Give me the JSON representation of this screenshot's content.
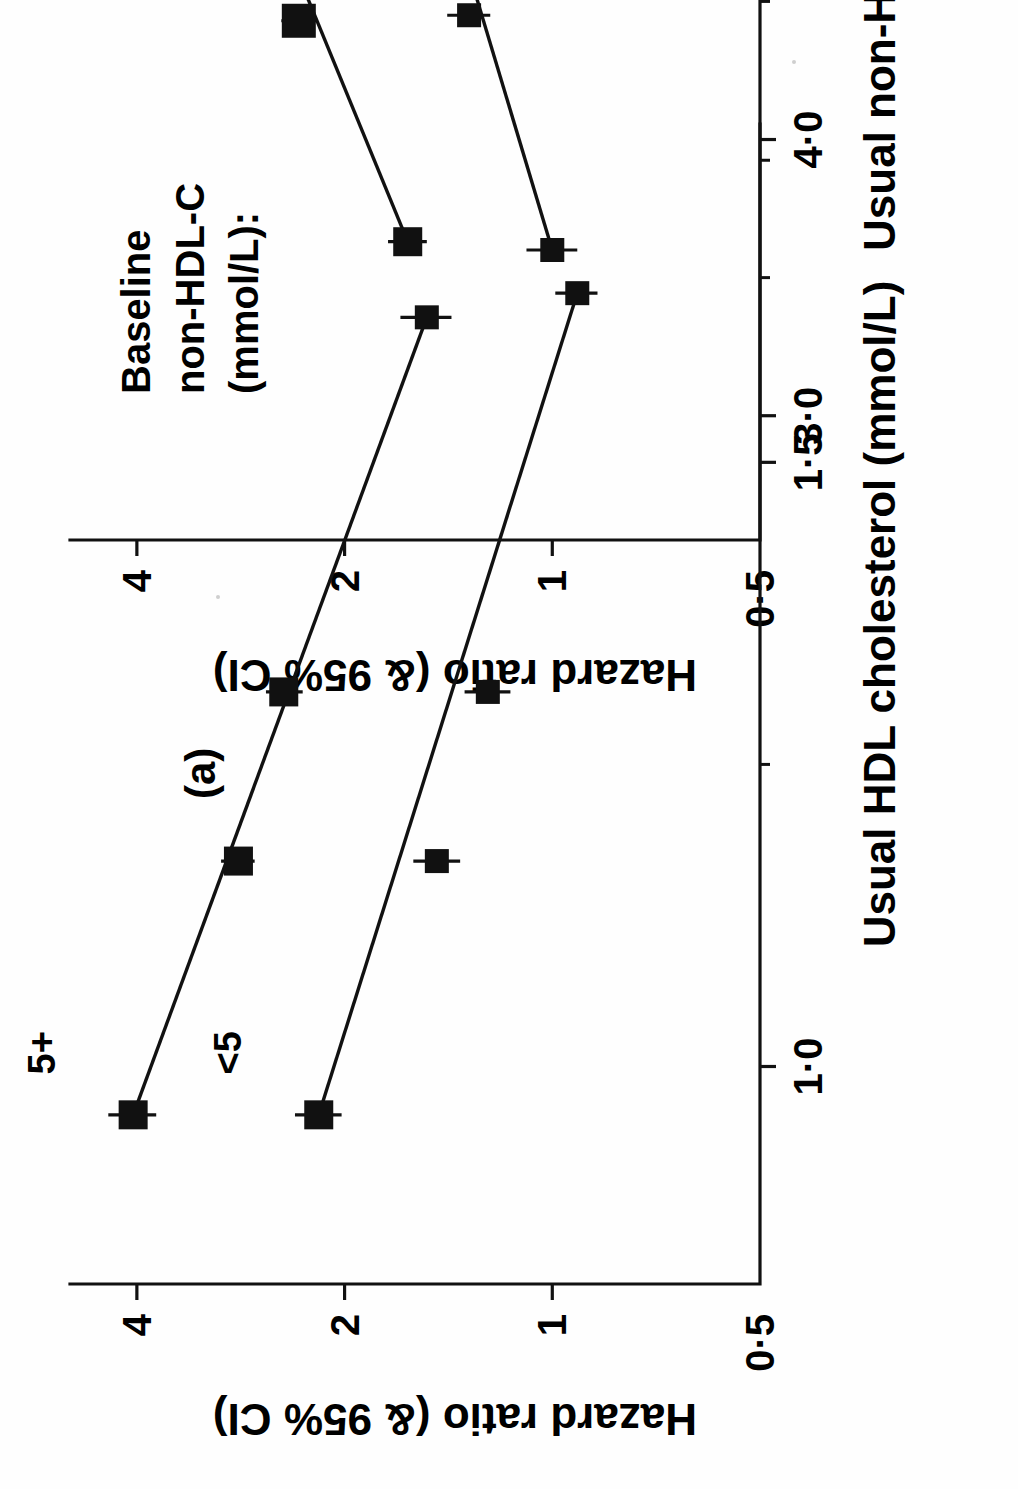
{
  "figure": {
    "background": "#ffffff",
    "ink_color": "#111111",
    "orientation": "rotated-90-ccw"
  },
  "chart_data": [
    {
      "id": "panel-a",
      "type": "scatter",
      "panel_label": "(a)",
      "title": "",
      "xlabel": "Usual HDL cholesterol (mmol/L)",
      "ylabel": "Hazard ratio (& 95% CI)",
      "xlim": [
        0.82,
        1.78
      ],
      "ylim": [
        0.5,
        5.0
      ],
      "yscale": "log",
      "grid": false,
      "xticks": [
        1.0,
        1.5
      ],
      "xticklabels": [
        "1·0",
        "1·5"
      ],
      "xminorticks": [
        1.25,
        1.75
      ],
      "yticks": [
        0.5,
        1,
        2,
        4
      ],
      "yticklabels": [
        "0·5",
        "1",
        "2",
        "4"
      ],
      "legend_title": "Baseline\nnon-HDL-C\n(mmol/L):",
      "legend_title_lines": [
        "Baseline",
        "non-HDL-C",
        "(mmol/L):"
      ],
      "legend_position": "upper-right-inside",
      "series": [
        {
          "name": "5+",
          "label": "5+",
          "points": [
            {
              "x": 0.96,
              "y": 4.05,
              "lo": 3.75,
              "hi": 4.4,
              "weight": 3
            },
            {
              "x": 1.17,
              "y": 2.85,
              "lo": 2.7,
              "hi": 3.02,
              "weight": 3
            },
            {
              "x": 1.31,
              "y": 2.45,
              "lo": 2.3,
              "hi": 2.6,
              "weight": 3
            },
            {
              "x": 1.62,
              "y": 1.52,
              "lo": 1.4,
              "hi": 1.66,
              "weight": 2
            }
          ]
        },
        {
          "name": "<5",
          "label": "<5",
          "points": [
            {
              "x": 0.96,
              "y": 2.18,
              "lo": 2.02,
              "hi": 2.36,
              "weight": 3
            },
            {
              "x": 1.17,
              "y": 1.47,
              "lo": 1.36,
              "hi": 1.59,
              "weight": 2
            },
            {
              "x": 1.31,
              "y": 1.24,
              "lo": 1.15,
              "hi": 1.34,
              "weight": 2
            },
            {
              "x": 1.64,
              "y": 0.92,
              "lo": 0.86,
              "hi": 0.99,
              "weight": 2
            }
          ]
        }
      ]
    },
    {
      "id": "panel-b",
      "type": "scatter",
      "panel_label": "(b)",
      "title": "",
      "xlabel": "Usual non-HDL cholesterol (mmol/L)",
      "ylabel": "Hazard ratio (& 95% CI)",
      "xlim": [
        2.55,
        6.75
      ],
      "ylim": [
        0.5,
        5.0
      ],
      "yscale": "log",
      "grid": false,
      "xticks": [
        3.0,
        4.0,
        5.0,
        6.0
      ],
      "xticklabels": [
        "3·0",
        "4·0",
        "5·0",
        "6·0"
      ],
      "xminorticks": [
        3.5,
        4.5,
        5.5,
        6.5
      ],
      "yticks": [
        0.5,
        1,
        2,
        4
      ],
      "yticklabels": [
        "0·5",
        "1",
        "2",
        "4"
      ],
      "legend_title": "Baseline\nHDL-C\n(mmol/L):",
      "legend_title_lines": [
        "Baseline",
        "HDL‐C",
        "(mmol/L):"
      ],
      "legend_position": "upper-right-inside",
      "series": [
        {
          "name": "<1·25",
          "label": "<1·25",
          "points": [
            {
              "x": 6.05,
              "y": 4.05,
              "lo": 3.62,
              "hi": 4.52,
              "weight": 3
            },
            {
              "x": 5.07,
              "y": 3.02,
              "lo": 2.86,
              "hi": 3.2,
              "weight": 4
            },
            {
              "x": 4.43,
              "y": 2.33,
              "lo": 2.2,
              "hi": 2.47,
              "weight": 4
            },
            {
              "x": 3.63,
              "y": 1.62,
              "lo": 1.52,
              "hi": 1.73,
              "weight": 3
            }
          ]
        },
        {
          "name": "1·25+",
          "label": "1·25+",
          "points": [
            {
              "x": 6.05,
              "y": 1.97,
              "lo": 1.7,
              "hi": 2.3,
              "weight": 2
            },
            {
              "x": 5.07,
              "y": 1.88,
              "lo": 1.76,
              "hi": 2.01,
              "weight": 3
            },
            {
              "x": 4.45,
              "y": 1.32,
              "lo": 1.23,
              "hi": 1.42,
              "weight": 2
            },
            {
              "x": 3.6,
              "y": 1.0,
              "lo": 0.92,
              "hi": 1.09,
              "weight": 2
            }
          ]
        }
      ]
    }
  ]
}
